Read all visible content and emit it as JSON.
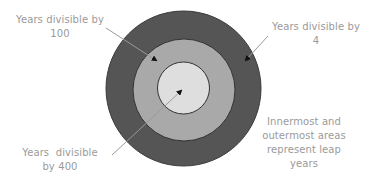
{
  "diagram": {
    "colors": {
      "outer_ring": "#555555",
      "middle_ring": "#a9a9a9",
      "inner_circle": "#dedede",
      "ring_border": "#333333",
      "arrow": "#9a9a9a",
      "arrowhead": "#111111",
      "label_text": "#9a9a9a"
    },
    "circles": [
      {
        "name": "outer",
        "represents": "Years divisible by 4",
        "cx": 183.5,
        "cy": 88.5,
        "r": 77.5
      },
      {
        "name": "middle",
        "represents": "Years divisible by 100",
        "cx": 184,
        "cy": 90,
        "r": 51
      },
      {
        "name": "inner",
        "represents": "Years divisible by 400",
        "cx": 183.5,
        "cy": 88,
        "r": 26
      }
    ],
    "labels": {
      "div100": {
        "line1": "Years divisible by",
        "line2": "100"
      },
      "div4": {
        "line1": "Years divisible by",
        "line2": "4"
      },
      "div400": {
        "line1": "Years  divisible",
        "line2": "by 400"
      },
      "note": {
        "line1": "Innermost and",
        "line2": "outermost areas",
        "line3": "represent leap",
        "line4": "years"
      }
    }
  }
}
